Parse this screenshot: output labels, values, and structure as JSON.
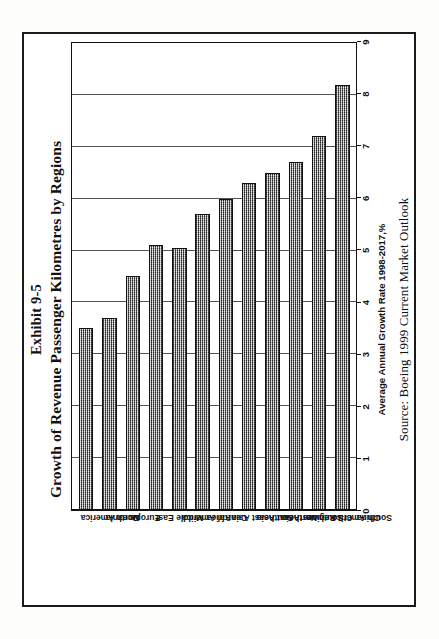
{
  "figure": {
    "exhibit_label": "Exhibit 9-5",
    "title": "Growth of Revenue Passenger Kilometres by Regions",
    "source_note": "Source: Boeing 1999 Current Market Outlook"
  },
  "chart_data": {
    "type": "bar",
    "orientation": "vertical",
    "title": "Growth of Revenue Passenger Kilometres by Regions",
    "subtitle": "Exhibit 9-5",
    "xlabel": "",
    "ylabel": "Average Annual Growth Rate 1998-2017,%",
    "ylim": [
      0,
      9
    ],
    "yticks": [
      0,
      1,
      2,
      3,
      4,
      5,
      6,
      7,
      8,
      9
    ],
    "ytick_labels": [
      "0",
      "1",
      "2",
      "3",
      "4",
      "5",
      "6",
      "7",
      "8",
      "9"
    ],
    "grid": true,
    "legend": false,
    "categories": [
      "North America",
      "Oceania",
      "Europe",
      "Middle East",
      "Central America",
      "Africa",
      "Southeast Asia",
      "Northeast Asia",
      "SouthwestAsia",
      "CIS Region",
      "South America",
      "China"
    ],
    "values": [
      3.5,
      3.7,
      4.5,
      5.1,
      5.05,
      5.7,
      6.0,
      6.3,
      6.5,
      6.7,
      7.2,
      8.2
    ],
    "annotations": [
      "Source: Boeing 1999 Current Market Outlook"
    ],
    "colors": {
      "bar_fill": "#8a8a8a",
      "bar_edge": "#111111",
      "gridline": "#555555",
      "axis": "#111111"
    }
  }
}
